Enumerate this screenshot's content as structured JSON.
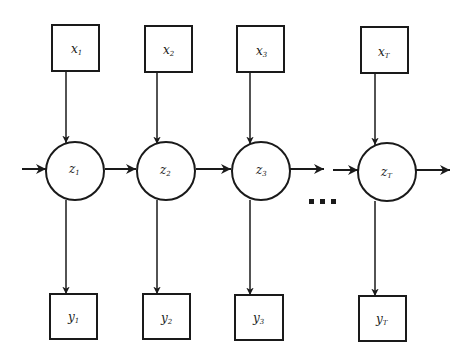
{
  "diagram": {
    "type": "hidden-markov-model",
    "inputs": [
      {
        "label": "x",
        "sub": "1",
        "cx": 76,
        "cy": 48
      },
      {
        "label": "x",
        "sub": "2",
        "cx": 168,
        "cy": 48
      },
      {
        "label": "x",
        "sub": "3",
        "cx": 260,
        "cy": 48
      },
      {
        "label": "x",
        "sub": "T",
        "cx": 385,
        "cy": 49
      }
    ],
    "states": [
      {
        "label": "z",
        "sub": "1",
        "cx": 75,
        "cy": 171
      },
      {
        "label": "z",
        "sub": "2",
        "cx": 165,
        "cy": 172
      },
      {
        "label": "z",
        "sub": "3",
        "cx": 250,
        "cy": 172
      },
      {
        "label": "z",
        "sub": "T",
        "cx": 387,
        "cy": 173
      }
    ],
    "outputs": [
      {
        "label": "y",
        "sub": "1",
        "cx": 74,
        "cy": 320
      },
      {
        "label": "y",
        "sub": "2",
        "cx": 166,
        "cy": 320
      },
      {
        "label": "y",
        "sub": "3",
        "cx": 259,
        "cy": 321
      },
      {
        "label": "y",
        "sub": "T",
        "cx": 383,
        "cy": 322
      }
    ],
    "ellipsis": "...",
    "colors": {
      "stroke": "#1a1a1a",
      "background": "#ffffff"
    }
  }
}
